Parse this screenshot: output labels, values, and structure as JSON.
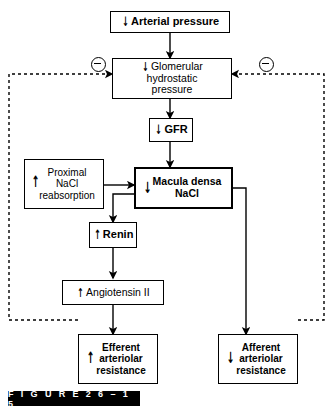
{
  "figure": {
    "label": "F I G U R E   2 6 – 1 5",
    "number": "26-15"
  },
  "diagram": {
    "nodes": {
      "arterial_pressure": {
        "arrow": "↓",
        "text": "Arterial pressure"
      },
      "glomerular_pressure": {
        "arrow": "↓",
        "line1": "Glomerular hydrostatic",
        "line2": "pressure"
      },
      "gfr": {
        "arrow": "↓",
        "text": "GFR"
      },
      "proximal_nacl": {
        "arrow": "↑",
        "line1": "Proximal",
        "line2": "NaCl",
        "line3": "reabsorption"
      },
      "macula_densa": {
        "arrow": "↓",
        "line1": "Macula densa",
        "line2": "NaCl"
      },
      "renin": {
        "arrow": "↑",
        "text": "Renin"
      },
      "angiotensin": {
        "arrow": "↑",
        "text": "Angiotensin II"
      },
      "efferent": {
        "arrow": "↑",
        "line1": "Efferent",
        "line2": "arteriolar",
        "line3": "resistance"
      },
      "afferent": {
        "arrow": "↓",
        "line1": "Afferent",
        "line2": "arteriolar",
        "line3": "resistance"
      }
    },
    "feedback": {
      "left_sign": "⊖",
      "right_sign": "⊖"
    },
    "colors": {
      "stroke": "#000000",
      "background": "#ffffff",
      "caption_bar": "#000000",
      "caption_text": "#ffffff"
    }
  }
}
